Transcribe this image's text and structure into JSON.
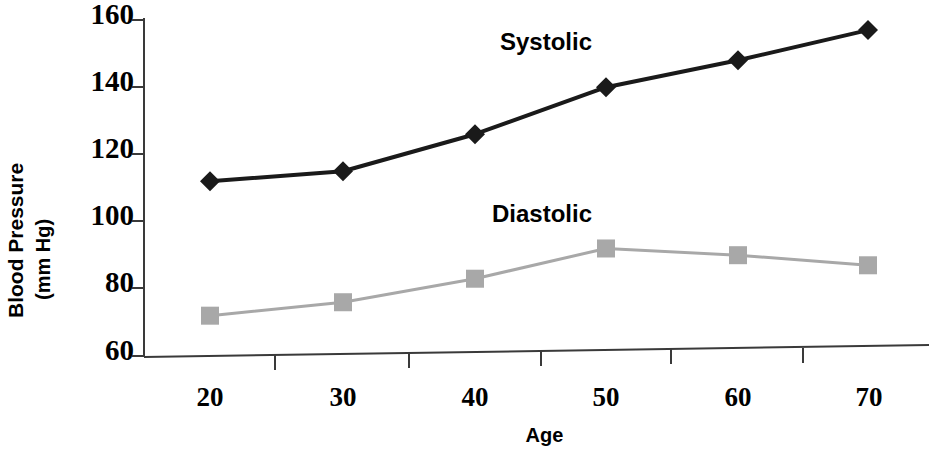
{
  "chart_data": {
    "type": "line",
    "title": "",
    "xlabel": "Age",
    "ylabel": "Blood Pressure (mm Hg)",
    "ylabel_lines": [
      "Blood Pressure",
      "(mm Hg)"
    ],
    "x": [
      20,
      30,
      40,
      50,
      60,
      70
    ],
    "xtick_labels": [
      "20",
      "30",
      "40",
      "50",
      "60",
      "70"
    ],
    "ytick_labels": [
      "60",
      "80",
      "100",
      "120",
      "140",
      "160"
    ],
    "yticks": [
      60,
      80,
      100,
      120,
      140,
      160
    ],
    "xlim": [
      14,
      76
    ],
    "ylim": [
      60,
      160
    ],
    "grid": false,
    "legend": "inline-annotations",
    "series": [
      {
        "name": "Systolic",
        "values": [
          112,
          115,
          126,
          140,
          148,
          157
        ],
        "color": "#1a1a1a",
        "marker": "diamond",
        "label_position": "above-line"
      },
      {
        "name": "Diastolic",
        "values": [
          72,
          76,
          83,
          92,
          90,
          87
        ],
        "color": "#a8a8a8",
        "marker": "square",
        "label_position": "above-line"
      }
    ],
    "annotations": [
      {
        "text": "Systolic",
        "x": 45,
        "y": 152
      },
      {
        "text": "Diastolic",
        "x": 44,
        "y": 104
      }
    ],
    "axis_color": "#3a3a3a"
  }
}
